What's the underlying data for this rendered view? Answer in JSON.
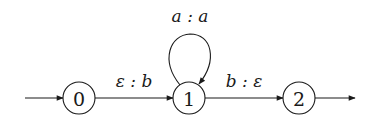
{
  "diagram": {
    "type": "finite-state-transducer",
    "states": [
      {
        "id": "0",
        "label": "0",
        "initial": true,
        "final": false
      },
      {
        "id": "1",
        "label": "1",
        "initial": false,
        "final": false
      },
      {
        "id": "2",
        "label": "2",
        "initial": false,
        "final": true
      }
    ],
    "transitions": [
      {
        "from": "0",
        "to": "1",
        "label": "ε : b"
      },
      {
        "from": "1",
        "to": "1",
        "label": "a : a"
      },
      {
        "from": "1",
        "to": "2",
        "label": "b : ε"
      }
    ]
  }
}
